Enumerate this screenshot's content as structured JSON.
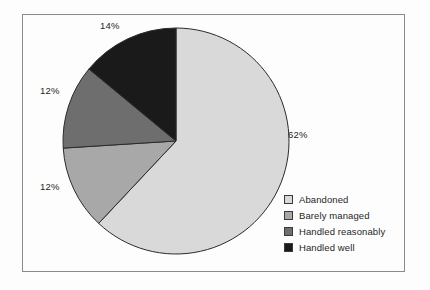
{
  "figure": {
    "background_color": "#fdfdfd",
    "frame_color": "#8a8a8a"
  },
  "labels": {
    "abandoned_pct": "62%",
    "barely_managed_pct": "12%",
    "handled_reasonably_pct": "12%",
    "handled_well_pct": "14%"
  },
  "legend": {
    "items": [
      {
        "label": "Abandoned",
        "color": "#d9d9d9"
      },
      {
        "label": "Barely managed",
        "color": "#a8a8a8"
      },
      {
        "label": "Handled reasonably",
        "color": "#6e6e6e"
      },
      {
        "label": "Handled well",
        "color": "#1a1a1a"
      }
    ]
  },
  "chart_data": {
    "type": "pie",
    "title": "",
    "categories": [
      "Abandoned",
      "Barely managed",
      "Handled reasonably",
      "Handled well"
    ],
    "values": [
      62,
      12,
      12,
      14
    ],
    "value_labels": [
      "62%",
      "12%",
      "12%",
      "14%"
    ],
    "colors": [
      "#d9d9d9",
      "#a8a8a8",
      "#6e6e6e",
      "#1a1a1a"
    ],
    "units": "percent",
    "total": 100,
    "start_angle_deg": 0,
    "direction": "clockwise",
    "legend_position": "bottom-right",
    "grid": false,
    "xlabel": "",
    "ylabel": ""
  }
}
